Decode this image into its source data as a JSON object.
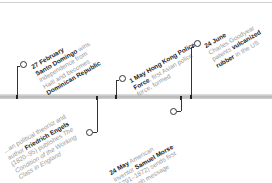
{
  "timeline": {
    "events": [
      {
        "date": "27 February",
        "lines": [
          {
            "bold": "Santo Domingo",
            "rest": " wins"
          },
          {
            "bold": "",
            "rest": "independence from"
          },
          {
            "bold": "",
            "rest": "Haiti and becomes"
          },
          {
            "bold": "Dominican Republic",
            "rest": ""
          }
        ]
      },
      {
        "date": "1 May",
        "lines": [
          {
            "bold": "Hong Kong Police",
            "rest": ""
          },
          {
            "bold": "Force",
            "rest": ", first Asian police"
          },
          {
            "bold": "",
            "rest": "force, formed"
          }
        ]
      },
      {
        "date": "24 June",
        "lines": [
          {
            "bold": "",
            "rest": "Charles Goodyear"
          },
          {
            "bold": "",
            "rest": "patents "
          },
          {
            "bold": "rubber",
            "rest": " in the US"
          }
        ],
        "line2_bold": "vulcanized"
      },
      {
        "lines": [
          {
            "pre": "...an political theorist and",
            "bold": "",
            "rest": ""
          },
          {
            "pre": "author ",
            "bold": "Friedrich Engels",
            "rest": ""
          },
          {
            "pre": "(1820–95) publishes ",
            "bold": "",
            "rest": "The"
          },
          {
            "pre": "Condition of the Working",
            "bold": "",
            "rest": ""
          },
          {
            "pre": "Class in England",
            "bold": "",
            "rest": ""
          }
        ]
      },
      {
        "date": "24 May",
        "lines": [
          {
            "pre": "",
            "bold": "",
            "rest": " American"
          },
          {
            "pre": "inventor ",
            "bold": "Samuel Morse",
            "rest": ""
          },
          {
            "pre": "(1791–1872) sends first",
            "bold": "",
            "rest": ""
          },
          {
            "pre": "telegraph message",
            "bold": "",
            "rest": ""
          }
        ]
      }
    ]
  },
  "colors": {
    "bar": "#c4c4c4",
    "connector": "#333333",
    "bold_text": "#222222",
    "light_text": "#9a9a9a"
  }
}
